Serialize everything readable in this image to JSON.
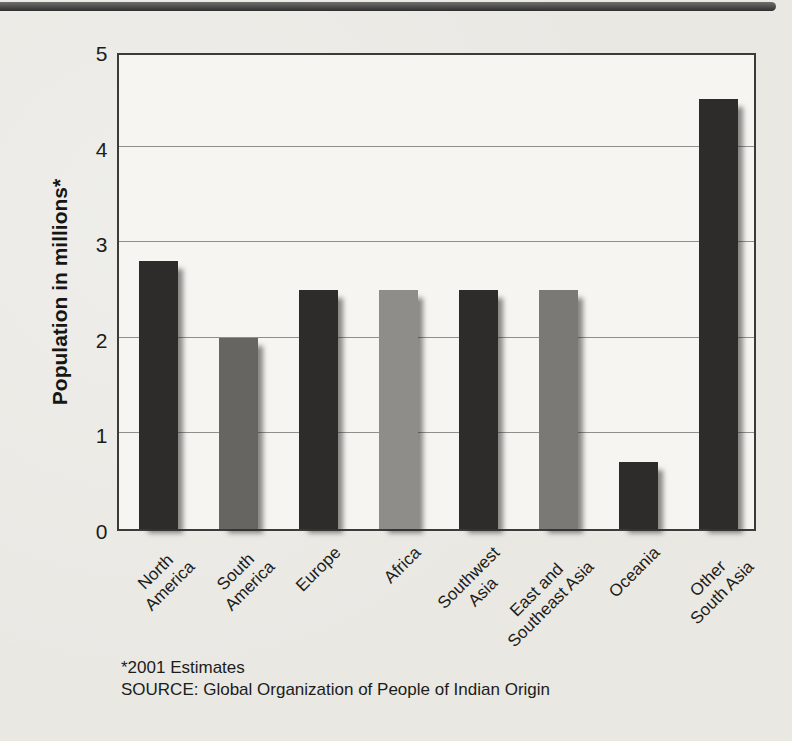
{
  "page": {
    "background": "#e9e8e3",
    "top_rule_color": "#3c3b39"
  },
  "chart_data": {
    "type": "bar",
    "title": "",
    "categories": [
      "North America",
      "South America",
      "Europe",
      "Africa",
      "Southwest Asia",
      "East and Southeast Asia",
      "Oceania",
      "Other South Asia"
    ],
    "category_lines": [
      [
        "North",
        "America"
      ],
      [
        "South",
        "America"
      ],
      [
        "Europe"
      ],
      [
        "Africa"
      ],
      [
        "Southwest",
        "Asia"
      ],
      [
        "East and",
        "Southeast Asia"
      ],
      [
        "Oceania"
      ],
      [
        "Other",
        "South Asia"
      ]
    ],
    "values": [
      2.8,
      2.0,
      2.5,
      2.5,
      2.5,
      2.5,
      0.7,
      4.5
    ],
    "bar_colors": [
      "#2d2c2a",
      "#666562",
      "#2d2c2a",
      "#8e8d8a",
      "#2d2c2a",
      "#7a7976",
      "#2d2c2a",
      "#2d2c2a"
    ],
    "xlabel": "",
    "ylabel": "Population in millions*",
    "ylim": [
      0,
      5
    ],
    "yticks": [
      0,
      1,
      2,
      3,
      4,
      5
    ],
    "grid": "horizontal",
    "legend": "none",
    "footnote": "*2001 Estimates",
    "source": "SOURCE: Global Organization of People of Indian Origin"
  }
}
